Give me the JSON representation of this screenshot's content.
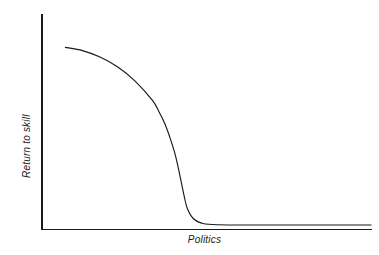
{
  "figure": {
    "background_color": "#ffffff",
    "line_color": "#1a1a1a",
    "axis_color": "#1a1a1a"
  },
  "chart_data": {
    "type": "line",
    "title": "",
    "xlabel": "Politics",
    "ylabel": "Return to skill",
    "grid": false,
    "legend": null,
    "xticklabels": [],
    "yticklabels": [],
    "xlim": [
      0,
      1
    ],
    "ylim": [
      0,
      1
    ],
    "annotations": [],
    "series": [
      {
        "name": "Return to skill vs politics",
        "description": "High plateau that decays slowly, then collapses almost vertically to near zero and stays flat",
        "x": [
          0.036,
          0.09,
          0.145,
          0.2,
          0.255,
          0.31,
          0.33,
          0.35,
          0.365,
          0.38,
          0.39,
          0.4,
          0.41,
          0.42,
          0.44,
          0.47,
          0.52,
          0.62,
          0.75,
          0.88,
          1.0
        ],
        "y": [
          0.845,
          0.83,
          0.8,
          0.755,
          0.69,
          0.6,
          0.55,
          0.49,
          0.43,
          0.36,
          0.3,
          0.23,
          0.16,
          0.1,
          0.05,
          0.028,
          0.022,
          0.021,
          0.021,
          0.021,
          0.021
        ]
      }
    ]
  },
  "labels": {
    "x_axis": "Politics",
    "y_axis": "Return to skill"
  }
}
